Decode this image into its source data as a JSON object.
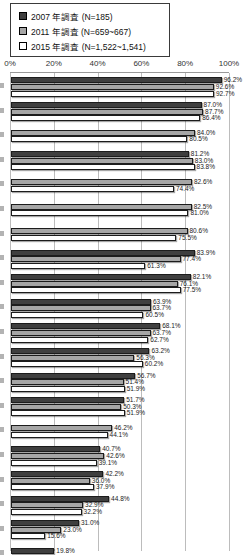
{
  "legend": {
    "items": [
      {
        "label": "2007 年調査 (N=185)",
        "color": "#3f3f3f"
      },
      {
        "label": "2011 年調査 (N=659~667)",
        "color": "#a6a6a6"
      },
      {
        "label": "2015 年調査 (N=1,522~1,541)",
        "color": "#ffffff"
      }
    ]
  },
  "chart_data": {
    "type": "bar",
    "orientation": "horizontal",
    "title": "",
    "xlabel": "",
    "ylabel": "",
    "xlim": [
      0,
      100
    ],
    "grid": true,
    "legend_position": "top-left",
    "x_ticks": [
      "0%",
      "20%",
      "40%",
      "60%",
      "80%",
      "100%"
    ],
    "note": "category labels cropped off left edge of screenshot; last group cut off at bottom",
    "series": [
      {
        "name": "2007 年調査 (N=185)",
        "color": "#3f3f3f"
      },
      {
        "name": "2011 年調査 (N=659~667)",
        "color": "#a6a6a6"
      },
      {
        "name": "2015 年調査 (N=1,522~1,541)",
        "color": "#ffffff"
      }
    ],
    "groups": [
      {
        "values": [
          96.2,
          92.6,
          92.7
        ]
      },
      {
        "values": [
          87.0,
          87.7,
          86.4
        ]
      },
      {
        "values": [
          null,
          84.0,
          80.5
        ]
      },
      {
        "values": [
          81.2,
          83.0,
          83.8
        ]
      },
      {
        "values": [
          null,
          82.6,
          74.4
        ]
      },
      {
        "values": [
          null,
          82.5,
          81.0
        ]
      },
      {
        "values": [
          null,
          80.6,
          75.5
        ]
      },
      {
        "values": [
          83.9,
          77.4,
          61.3
        ]
      },
      {
        "values": [
          82.1,
          76.1,
          77.5
        ]
      },
      {
        "values": [
          63.9,
          63.7,
          60.5
        ]
      },
      {
        "values": [
          68.1,
          63.7,
          62.7
        ]
      },
      {
        "values": [
          63.2,
          56.3,
          60.2
        ]
      },
      {
        "values": [
          56.7,
          51.4,
          51.9
        ]
      },
      {
        "values": [
          51.7,
          50.3,
          51.9
        ]
      },
      {
        "values": [
          null,
          46.2,
          44.1
        ]
      },
      {
        "values": [
          40.7,
          42.6,
          39.1
        ]
      },
      {
        "values": [
          42.2,
          36.0,
          37.9
        ]
      },
      {
        "values": [
          44.8,
          32.9,
          32.2
        ]
      },
      {
        "values": [
          31.0,
          23.0,
          15.6
        ]
      },
      {
        "values": [
          19.8,
          null,
          null
        ],
        "partial": true
      }
    ]
  }
}
